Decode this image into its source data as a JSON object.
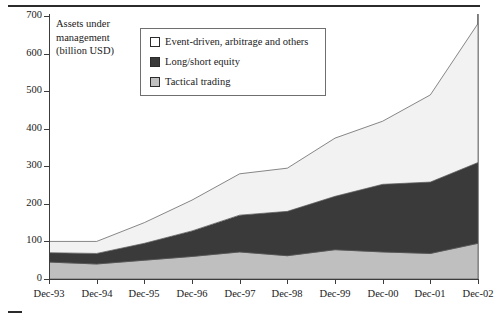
{
  "chart_data": {
    "type": "area",
    "stacked": true,
    "title": "",
    "axis_title": "Assets under management (billion USD)",
    "axis_title_lines": [
      "Assets under",
      "management",
      "(billion USD)"
    ],
    "xlabel": "",
    "ylabel": "Assets under management (billion USD)",
    "categories": [
      "Dec-93",
      "Dec-94",
      "Dec-95",
      "Dec-96",
      "Dec-97",
      "Dec-98",
      "Dec-99",
      "Dec-00",
      "Dec-01",
      "Dec-02"
    ],
    "x": [
      "Dec-93",
      "Dec-94",
      "Dec-95",
      "Dec-96",
      "Dec-97",
      "Dec-98",
      "Dec-99",
      "Dec-00",
      "Dec-01",
      "Dec-02"
    ],
    "ylim": [
      0,
      700
    ],
    "yticks": [
      0,
      100,
      200,
      300,
      400,
      500,
      600,
      700
    ],
    "ytick_labels": [
      "0",
      "100",
      "200",
      "300",
      "400",
      "500",
      "600",
      "700"
    ],
    "grid": false,
    "legend_position": "top-center",
    "series": [
      {
        "name": "Tactical trading",
        "color": "#bfbfbf",
        "values": [
          45,
          40,
          50,
          60,
          72,
          62,
          78,
          72,
          68,
          95
        ]
      },
      {
        "name": "Long/short equity",
        "color": "#3a3a3a",
        "values": [
          25,
          28,
          45,
          68,
          98,
          118,
          142,
          180,
          190,
          215
        ]
      },
      {
        "name": "Event-driven, arbitrage and others",
        "color": "#f2f2f2",
        "values": [
          30,
          32,
          55,
          82,
          110,
          115,
          155,
          168,
          232,
          370
        ]
      }
    ],
    "totals": [
      100,
      100,
      150,
      210,
      280,
      295,
      375,
      420,
      490,
      680
    ]
  },
  "legend": {
    "items": [
      {
        "label": "Event-driven, arbitrage and others",
        "swatch": "white-square-icon"
      },
      {
        "label": "Long/short equity",
        "swatch": "black-square-icon"
      },
      {
        "label": "Tactical trading",
        "swatch": "gray-square-icon"
      }
    ]
  },
  "colors": {
    "tactical": "#bfbfbf",
    "long_short": "#3a3a3a",
    "event_driven": "#f2f2f2",
    "axis": "#3c3c3c",
    "outline": "#6f6f6f",
    "background": "#ffffff"
  }
}
